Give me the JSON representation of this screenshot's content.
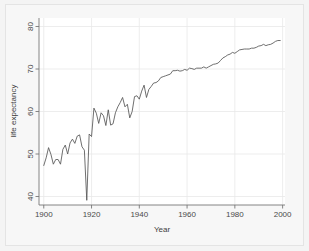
{
  "chart_data": {
    "type": "line",
    "title": "",
    "subtitle": "",
    "xlabel": "Year",
    "ylabel": "life expectancy",
    "xlim": [
      1898,
      2001
    ],
    "ylim": [
      38,
      82
    ],
    "xticks": [
      1900,
      1920,
      1940,
      1960,
      1980,
      2000
    ],
    "xticklabels": [
      "1900",
      "1920",
      "1940",
      "1960",
      "1980",
      "2000"
    ],
    "yticks": [
      40,
      50,
      60,
      70,
      80
    ],
    "yticklabels": [
      "40",
      "50",
      "60",
      "70",
      "80"
    ],
    "grid": "faint-horizontal-and-vertical",
    "legend": "none",
    "line_color": "#555555",
    "series": [
      {
        "name": "life expectancy",
        "x": [
          1900,
          1901,
          1902,
          1903,
          1904,
          1905,
          1906,
          1907,
          1908,
          1909,
          1910,
          1911,
          1912,
          1913,
          1914,
          1915,
          1916,
          1917,
          1918,
          1919,
          1920,
          1921,
          1922,
          1923,
          1924,
          1925,
          1926,
          1927,
          1928,
          1929,
          1930,
          1931,
          1932,
          1933,
          1934,
          1935,
          1936,
          1937,
          1938,
          1939,
          1940,
          1941,
          1942,
          1943,
          1944,
          1945,
          1946,
          1947,
          1948,
          1949,
          1950,
          1951,
          1952,
          1953,
          1954,
          1955,
          1956,
          1957,
          1958,
          1959,
          1960,
          1961,
          1962,
          1963,
          1964,
          1965,
          1966,
          1967,
          1968,
          1969,
          1970,
          1971,
          1972,
          1973,
          1974,
          1975,
          1976,
          1977,
          1978,
          1979,
          1980,
          1981,
          1982,
          1983,
          1984,
          1985,
          1986,
          1987,
          1988,
          1989,
          1990,
          1991,
          1992,
          1993,
          1994,
          1995,
          1996,
          1997,
          1998,
          1999
        ],
        "values": [
          47.3,
          49.1,
          51.5,
          49.9,
          47.6,
          48.7,
          48.7,
          47.6,
          51.1,
          52.1,
          50.0,
          52.6,
          53.5,
          52.5,
          54.2,
          54.5,
          51.7,
          50.9,
          39.1,
          54.7,
          54.1,
          60.8,
          59.6,
          57.2,
          59.7,
          59.0,
          56.7,
          60.4,
          56.8,
          57.1,
          59.7,
          61.1,
          62.1,
          63.3,
          61.1,
          61.7,
          58.5,
          60.0,
          63.5,
          63.7,
          62.9,
          64.8,
          66.2,
          63.3,
          65.2,
          65.9,
          66.7,
          66.8,
          67.2,
          68.0,
          68.2,
          68.4,
          68.6,
          68.8,
          69.6,
          69.6,
          69.7,
          69.5,
          69.6,
          69.9,
          69.7,
          70.2,
          70.1,
          69.9,
          70.2,
          70.2,
          70.2,
          70.5,
          70.2,
          70.5,
          70.8,
          71.1,
          71.2,
          71.4,
          72.0,
          72.6,
          72.9,
          73.3,
          73.5,
          73.9,
          73.7,
          74.1,
          74.5,
          74.6,
          74.7,
          74.7,
          74.7,
          74.9,
          74.9,
          75.1,
          75.4,
          75.5,
          75.8,
          75.5,
          75.7,
          75.8,
          76.1,
          76.5,
          76.7,
          76.7
        ]
      }
    ]
  },
  "axes": {
    "x_title": "Year",
    "y_title": "life expectancy"
  }
}
